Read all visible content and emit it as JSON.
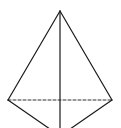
{
  "diagram": {
    "type": "tetrahedron",
    "stroke_color": "#1a1a1a",
    "background": "#ffffff",
    "vertices": {
      "apex": [
        60,
        11
      ],
      "left": [
        8,
        100
      ],
      "right": [
        112,
        100
      ],
      "front": [
        60,
        136
      ]
    },
    "edges": [
      {
        "name": "apex-left",
        "from": "apex",
        "to": "left",
        "style": "solid"
      },
      {
        "name": "apex-right",
        "from": "apex",
        "to": "right",
        "style": "solid"
      },
      {
        "name": "apex-front",
        "from": "apex",
        "to": "front",
        "style": "solid"
      },
      {
        "name": "left-front",
        "from": "left",
        "to": "front",
        "style": "solid"
      },
      {
        "name": "right-front",
        "from": "right",
        "to": "front",
        "style": "solid"
      },
      {
        "name": "left-right",
        "from": "left",
        "to": "right",
        "style": "dashed"
      }
    ]
  }
}
